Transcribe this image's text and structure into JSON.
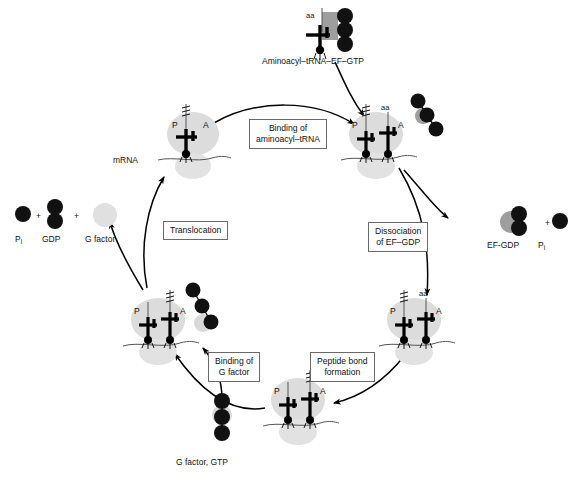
{
  "diagram": {
    "type": "cycle-diagram",
    "background_color": "#ffffff",
    "stroke_color": "#000000",
    "ribosome_color": "#d9d9d9",
    "factor_color": "#b3b3b3",
    "bead_color": "#111111"
  },
  "inputs": [
    {
      "id": "aminoacyl-trna-ef-gtp",
      "label": "Aminoacyl–tRNA–EF–GTP",
      "aa_label": "aa",
      "x": 334,
      "y": 30
    },
    {
      "id": "g-factor-gtp",
      "label": "G factor, GTP",
      "x": 222,
      "y": 420
    }
  ],
  "outputs": [
    {
      "id": "ef-gdp-pi",
      "parts": [
        {
          "text": "EF-GDP"
        },
        {
          "text": "+"
        },
        {
          "text": "P",
          "sub": "i"
        }
      ],
      "x": 520,
      "y": 215
    },
    {
      "id": "pi-gdp-gfactor",
      "parts": [
        {
          "text": "P",
          "sub": "i"
        },
        {
          "text": "+"
        },
        {
          "text": "GDP"
        },
        {
          "text": "+"
        },
        {
          "text": "G factor"
        }
      ],
      "x": 65,
      "y": 215
    }
  ],
  "process_steps": [
    {
      "id": "binding-aminoacyl-trna",
      "line1": "Binding of",
      "line2": "aminoacyl–tRNA",
      "x": 249,
      "y": 119
    },
    {
      "id": "dissociation-ef-gdp",
      "line1": "Dissociation",
      "line2": "of EF–GDP",
      "x": 368,
      "y": 222
    },
    {
      "id": "peptide-bond-formation",
      "line1": "Peptide bond",
      "line2": "formation",
      "x": 310,
      "y": 352
    },
    {
      "id": "binding-g-factor",
      "line1": "Binding of",
      "line2": "G factor",
      "x": 208,
      "y": 352
    },
    {
      "id": "translocation",
      "line1": "Translocation",
      "line2": "",
      "x": 163,
      "y": 221
    }
  ],
  "ribosomes": [
    {
      "id": "ribosome-post-translocation",
      "position": "top-left",
      "cx": 193,
      "cy": 140,
      "p_site": "P",
      "a_site": "A",
      "p_has_peptide": true,
      "a_occupied": false,
      "a_label": "",
      "mrna_label": "mRNA"
    },
    {
      "id": "ribosome-aa-trna-bound",
      "position": "top-right",
      "cx": 376,
      "cy": 140,
      "p_site": "P",
      "a_site": "A",
      "p_has_peptide": true,
      "a_occupied": true,
      "a_label": "aa",
      "mrna_label": ""
    },
    {
      "id": "ribosome-ef-released",
      "position": "right-bottom",
      "cx": 414,
      "cy": 320,
      "p_site": "P",
      "a_site": "A",
      "p_has_peptide": true,
      "a_occupied": true,
      "a_label": "aa",
      "mrna_label": ""
    },
    {
      "id": "ribosome-peptidyl-transferred",
      "position": "bottom",
      "cx": 298,
      "cy": 400,
      "p_site": "P",
      "a_site": "A",
      "p_has_peptide": false,
      "a_occupied": true,
      "a_label": "",
      "mrna_label": ""
    },
    {
      "id": "ribosome-g-factor-bound",
      "position": "left-bottom",
      "cx": 158,
      "cy": 320,
      "p_site": "P",
      "a_site": "A",
      "p_has_peptide": false,
      "a_occupied": true,
      "a_label": "",
      "mrna_label": ""
    }
  ],
  "free_factors": [
    {
      "id": "ef-gdp-beside-ribosome",
      "cx": 420,
      "cy": 120
    },
    {
      "id": "g-factor-beside-ribosome",
      "cx": 205,
      "cy": 305
    }
  ]
}
